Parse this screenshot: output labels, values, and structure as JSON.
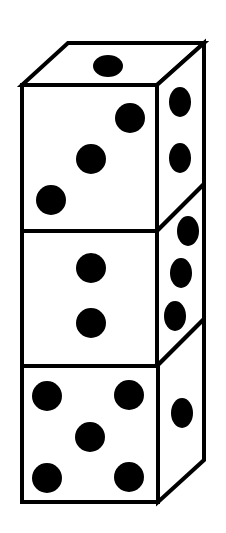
{
  "figure": {
    "title": "Stack of three dice",
    "colors": {
      "line": "#000000",
      "face": "#ffffff",
      "pip": "#000000"
    },
    "dice": [
      {
        "position": "top",
        "front_pips": 3,
        "side_pips": 2,
        "top_pips": 1
      },
      {
        "position": "middle",
        "front_pips": 2,
        "side_pips": 3
      },
      {
        "position": "bottom",
        "front_pips": 5,
        "side_pips": 1
      }
    ]
  }
}
